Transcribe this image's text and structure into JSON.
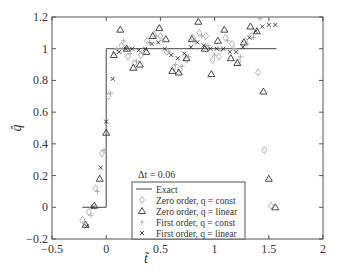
{
  "chart_data": {
    "type": "scatter",
    "title": "",
    "xlabel": "t̃",
    "ylabel": "q̂",
    "xlim": [
      -0.5,
      2
    ],
    "ylim": [
      -0.2,
      1.2
    ],
    "xticks": [
      -0.5,
      0,
      0.5,
      1,
      1.5,
      2
    ],
    "yticks": [
      -0.2,
      0,
      0.2,
      0.4,
      0.6,
      0.8,
      1,
      1.2
    ],
    "xtick_labels": [
      "−0.5",
      "0",
      "0.5",
      "1",
      "1.5",
      "2"
    ],
    "ytick_labels": [
      "−0.2",
      "0",
      "0.2",
      "0.4",
      "0.6",
      "0.8",
      "1",
      "1.2"
    ],
    "grid": false,
    "annotation": "Δt = 0.06",
    "legend_position": "lower center",
    "series": [
      {
        "name": "Exact",
        "marker": "line",
        "color": "#444444",
        "x": [
          -0.22,
          0,
          0,
          1.57
        ],
        "y": [
          0,
          0,
          1,
          1
        ]
      },
      {
        "name": "Zero order, q = const",
        "marker": "diamond",
        "color": "#aaaaaa",
        "x": [
          -0.22,
          -0.16,
          -0.1,
          -0.04,
          0.02,
          0.08,
          0.14,
          0.2,
          0.26,
          0.32,
          0.38,
          0.44,
          0.5,
          0.56,
          0.62,
          0.68,
          0.74,
          0.8,
          0.86,
          0.92,
          0.98,
          1.04,
          1.1,
          1.16,
          1.22,
          1.28,
          1.34,
          1.4,
          1.46,
          1.52
        ],
        "y": [
          -0.08,
          -0.03,
          0.12,
          0.34,
          0.7,
          0.98,
          1.02,
          0.95,
          0.91,
          0.96,
          1.05,
          1.09,
          1.08,
          0.98,
          0.88,
          0.87,
          0.93,
          1.07,
          1.1,
          1.08,
          0.93,
          0.95,
          1.07,
          1.03,
          0.92,
          1.05,
          1.08,
          0.85,
          0.36,
          0.01
        ]
      },
      {
        "name": "Zero order, q = linear",
        "marker": "triangle",
        "color": "#333333",
        "x": [
          -0.19,
          -0.11,
          -0.06,
          0.0,
          0.07,
          0.13,
          0.19,
          0.25,
          0.31,
          0.37,
          0.43,
          0.49,
          0.55,
          0.61,
          0.67,
          0.74,
          0.79,
          0.85,
          0.91,
          0.97,
          1.03,
          1.09,
          1.15,
          1.21,
          1.27,
          1.33,
          1.39,
          1.45,
          1.5,
          1.56
        ],
        "y": [
          -0.11,
          0.01,
          0.18,
          0.47,
          0.96,
          1.12,
          1.0,
          0.88,
          0.9,
          0.98,
          1.08,
          1.13,
          1.06,
          0.86,
          0.85,
          0.94,
          1.06,
          1.17,
          1.0,
          0.84,
          1.05,
          1.12,
          0.94,
          0.91,
          1.04,
          1.14,
          1.11,
          0.73,
          0.18,
          0.0
        ]
      },
      {
        "name": "First order, q = const",
        "marker": "plus",
        "color": "#aaaaaa",
        "x": [
          -0.2,
          -0.14,
          -0.08,
          -0.02,
          0.04,
          0.1,
          0.16,
          0.22,
          0.28,
          0.34,
          0.4,
          0.46,
          0.52,
          0.58,
          0.64,
          0.7,
          0.76,
          0.82,
          0.88,
          0.94,
          1.0,
          1.06,
          1.12,
          1.18,
          1.24,
          1.3,
          1.36,
          1.42
        ],
        "y": [
          -0.1,
          -0.05,
          0.1,
          0.36,
          0.72,
          1.0,
          1.05,
          0.97,
          0.92,
          0.97,
          1.04,
          1.08,
          1.05,
          0.98,
          0.9,
          0.89,
          0.95,
          1.05,
          1.08,
          1.02,
          0.96,
          0.99,
          1.05,
          1.0,
          0.95,
          1.03,
          1.07,
          1.19
        ]
      },
      {
        "name": "First order, q = linear",
        "marker": "x",
        "color": "#333333",
        "x": [
          -0.18,
          -0.12,
          -0.05,
          0.0,
          0.06,
          0.12,
          0.18,
          0.24,
          0.3,
          0.36,
          0.42,
          0.48,
          0.54,
          0.6,
          0.66,
          0.72,
          0.78,
          0.84,
          0.9,
          0.96,
          1.02,
          1.08,
          1.14,
          1.2,
          1.26,
          1.32,
          1.38,
          1.44,
          1.5,
          1.56
        ],
        "y": [
          -0.12,
          0.0,
          0.25,
          0.54,
          0.81,
          0.98,
          1.0,
          1.0,
          0.99,
          1.0,
          1.03,
          1.04,
          1.0,
          0.96,
          0.94,
          0.97,
          1.01,
          1.04,
          1.02,
          1.0,
          1.0,
          1.0,
          0.98,
          0.98,
          1.01,
          1.07,
          1.11,
          1.14,
          1.15,
          1.15
        ]
      }
    ]
  }
}
